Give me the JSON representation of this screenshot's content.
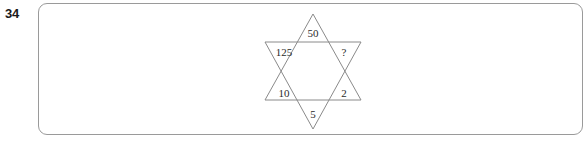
{
  "item": {
    "number": "34"
  },
  "figure": {
    "name": "hexagram-star-puzzle",
    "shape": "six-pointed-star",
    "line_color": "#8a8a8a",
    "labels": {
      "top": "50",
      "upper_left": "125",
      "upper_right": "?",
      "lower_left": "10",
      "lower_right": "2",
      "bottom": "5"
    }
  },
  "answer_box": {
    "border_color": "#9a9a9a",
    "fill": "#ffffff"
  }
}
